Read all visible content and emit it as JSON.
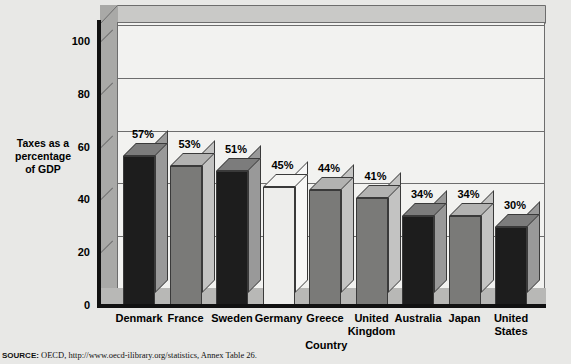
{
  "chart_data": {
    "type": "bar",
    "title": "",
    "subtitle": "",
    "xlabel": "Country",
    "ylabel": "Taxes as a percentage of GDP",
    "ylabel_lines": [
      "Taxes as a",
      "percentage",
      "of GDP"
    ],
    "categories": [
      "Denmark",
      "France",
      "Sweden",
      "Germany",
      "Greece",
      "United Kingdom",
      "Australia",
      "Japan",
      "United States"
    ],
    "category_lines": [
      [
        "Denmark"
      ],
      [
        "France"
      ],
      [
        "Sweden"
      ],
      [
        "Germany"
      ],
      [
        "Greece"
      ],
      [
        "United",
        "Kingdom"
      ],
      [
        "Australia"
      ],
      [
        "Japan"
      ],
      [
        "United",
        "States"
      ]
    ],
    "values": [
      57,
      53,
      51,
      45,
      44,
      41,
      34,
      34,
      30
    ],
    "value_labels": [
      "57%",
      "53%",
      "51%",
      "45%",
      "44%",
      "41%",
      "34%",
      "34%",
      "30%"
    ],
    "ylim": [
      0,
      110
    ],
    "yticks": [
      0,
      20,
      40,
      60,
      80,
      100
    ],
    "ytick_labels": [
      "0",
      "20",
      "40",
      "60",
      "80",
      "100"
    ],
    "grid": true,
    "legend": "none",
    "style": "3d-column",
    "bar_colors": [
      "#1d1d1d",
      "#7a7a78",
      "#1d1d1d",
      "#ededeb",
      "#7a7a78",
      "#7a7a78",
      "#1d1d1d",
      "#7a7a78",
      "#1d1d1d"
    ]
  },
  "colors": {
    "page_background": "#e8e8e6",
    "plot_background": "#f2f2f0",
    "axis": "#111111",
    "gridline": "#6d6d6d",
    "wall_left": "#a9a9a7",
    "wall_top": "#c9c9c7",
    "floor": "#b8b8b6",
    "bar_dark": "#1d1d1d",
    "bar_gray": "#7a7a78",
    "bar_light": "#ededeb"
  },
  "source": {
    "prefix": "SOURCE:",
    "text": "OECD, http://www.oecd-ilibrary.org/statistics, Annex Table 26."
  }
}
